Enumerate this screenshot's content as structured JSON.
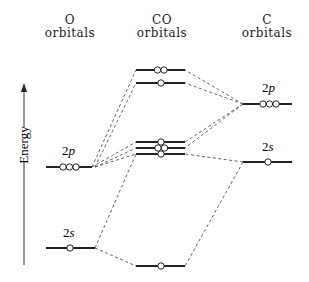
{
  "headers": {
    "o": {
      "line1": "O",
      "line2": "orbitals"
    },
    "co": {
      "line1": "CO",
      "line2": "orbitals"
    },
    "c": {
      "line1": "C",
      "line2": "orbitals"
    }
  },
  "axis": {
    "label": "Energy",
    "direction": "up"
  },
  "atomic_levels": {
    "o_2p": {
      "num": "2",
      "sub": "p",
      "electrons": 3
    },
    "o_2s": {
      "num": "2",
      "sub": "s",
      "electrons": 1
    },
    "c_2p": {
      "num": "2",
      "sub": "p",
      "electrons": 3
    },
    "c_2s": {
      "num": "2",
      "sub": "s",
      "electrons": 1
    }
  },
  "molecular_levels": [
    {
      "id": "co_top",
      "electrons": 2
    },
    {
      "id": "co_second",
      "electrons": 1
    },
    {
      "id": "co_cluster_1",
      "electrons": 1
    },
    {
      "id": "co_cluster_2",
      "electrons": 2
    },
    {
      "id": "co_cluster_3",
      "electrons": 1
    },
    {
      "id": "co_bottom",
      "electrons": 1
    }
  ],
  "colors": {
    "line": "#222222",
    "dash": "#555555",
    "background": "#ffffff"
  }
}
